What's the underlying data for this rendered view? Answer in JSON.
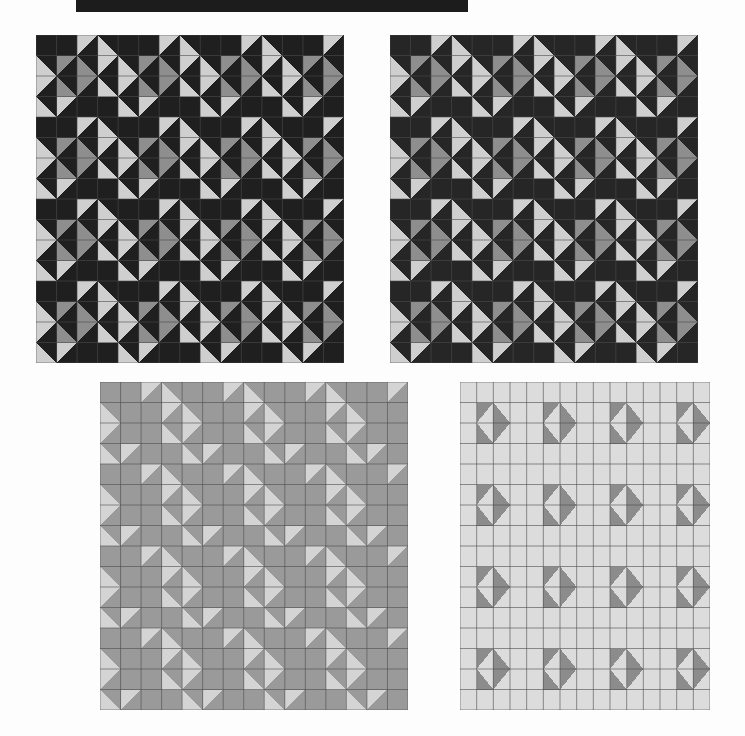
{
  "page": {
    "title": "Quilt Pattern Variations",
    "background_color": "#fdfdfd",
    "width": 745,
    "height": 736
  },
  "banner": {
    "label": "",
    "color": "#1c1c1c",
    "x": 76,
    "y": 0,
    "width": 392,
    "height": 12
  },
  "grid": {
    "rows": 2,
    "cols": 2,
    "cell_rows": 16,
    "cell_cols": 15,
    "block_size": 4,
    "line_color": "#4b4b4b",
    "line_width": 0.6
  },
  "chart_data": {
    "type": "heatmap",
    "title": "Quilt Pattern Variations",
    "xlabel": "",
    "ylabel": "",
    "grid": true,
    "legend_position": "none",
    "panels": [
      {
        "name": "quilt-top-left",
        "label": "Panel 1",
        "x": 36,
        "y": 35,
        "width": 308,
        "height": 328,
        "palette": {
          "dark": "#1f1f1f",
          "mid_dark": "#3a3a3a",
          "mid": "#8e8e8e",
          "light": "#cfcfcf"
        },
        "tone_map": {
          "A": "dark",
          "B": "dark",
          "C": "mid",
          "D": "light"
        },
        "background": "#1f1f1f"
      },
      {
        "name": "quilt-top-right",
        "label": "Panel 2",
        "x": 390,
        "y": 35,
        "width": 308,
        "height": 328,
        "palette": {
          "dark": "#262626",
          "mid_dark": "#4e4e4e",
          "mid": "#8e8e8e",
          "light": "#cfcfcf"
        },
        "tone_map": {
          "A": "dark",
          "B": "mid_dark",
          "C": "mid",
          "D": "light"
        },
        "background": "#4e4e4e"
      },
      {
        "name": "quilt-bottom-left",
        "label": "Panel 3",
        "x": 100,
        "y": 382,
        "width": 308,
        "height": 328,
        "palette": {
          "dark": "#2b2b2b",
          "mid_dark": "#5f5f5f",
          "mid": "#9a9a9a",
          "light": "#d4d4d4"
        },
        "tone_map": {
          "A": "mid",
          "B": "mid_dark",
          "C": "mid",
          "D": "light"
        },
        "background": "#9a9a9a"
      },
      {
        "name": "quilt-bottom-right",
        "label": "Panel 4",
        "x": 460,
        "y": 382,
        "width": 250,
        "height": 328,
        "palette": {
          "dark": "#242424",
          "mid_dark": "#8c8c8c",
          "mid": "#bdbdbd",
          "light": "#dcdcdc"
        },
        "tone_map": {
          "A": "light",
          "B": "dark",
          "C": "mid_dark",
          "D": "light"
        },
        "background": "#dcdcdc"
      }
    ],
    "block_definition": {
      "comment": "4x4 block of half-square-triangle cells. Each cell lists the tone key for its two triangles as [upper-left-triangle, lower-right-triangle] when diagonal is '\\', or [upper-right, lower-left] when diagonal is '/'.",
      "cells": [
        [
          {
            "d": "\\",
            "t": [
              "A",
              "A"
            ]
          },
          {
            "d": "/",
            "t": [
              "A",
              "A"
            ]
          },
          {
            "d": "\\",
            "t": [
              "D",
              "A"
            ]
          },
          {
            "d": "/",
            "t": [
              "A",
              "D"
            ]
          }
        ],
        [
          {
            "d": "/",
            "t": [
              "A",
              "D"
            ]
          },
          {
            "d": "\\",
            "t": [
              "C",
              "A"
            ]
          },
          {
            "d": "/",
            "t": [
              "A",
              "C"
            ]
          },
          {
            "d": "\\",
            "t": [
              "D",
              "A"
            ]
          }
        ],
        [
          {
            "d": "\\",
            "t": [
              "D",
              "A"
            ]
          },
          {
            "d": "/",
            "t": [
              "A",
              "C"
            ]
          },
          {
            "d": "\\",
            "t": [
              "C",
              "A"
            ]
          },
          {
            "d": "/",
            "t": [
              "A",
              "D"
            ]
          }
        ],
        [
          {
            "d": "/",
            "t": [
              "A",
              "D"
            ]
          },
          {
            "d": "\\",
            "t": [
              "D",
              "A"
            ]
          },
          {
            "d": "/",
            "t": [
              "A",
              "A"
            ]
          },
          {
            "d": "\\",
            "t": [
              "A",
              "A"
            ]
          }
        ]
      ]
    }
  }
}
